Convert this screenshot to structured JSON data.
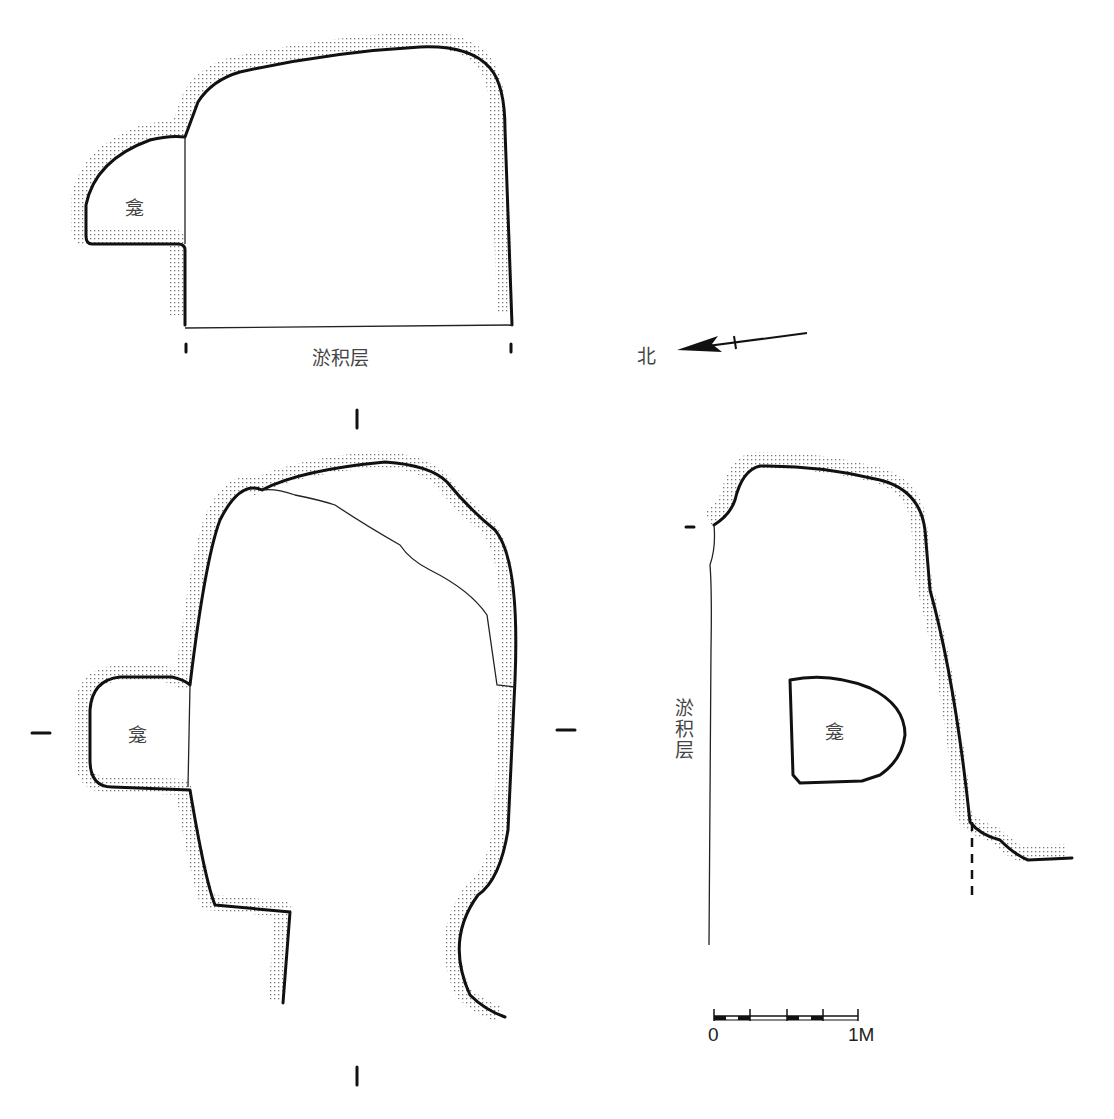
{
  "figure": {
    "type": "archaeological cave plan and sections",
    "plan_top": {
      "niche_label": "龛",
      "deposit_label": "淤积层"
    },
    "compass": {
      "label": "北",
      "direction": "north-arrow"
    },
    "plan_main": {
      "niche_label": "龛",
      "section_markers": [
        "I",
        "I",
        "—",
        "—"
      ]
    },
    "section_side": {
      "niche_label": "龛",
      "deposit_label": "淤积层"
    },
    "scale_bar": {
      "start_label": "0",
      "end_label": "1M"
    },
    "colors": {
      "line": "#111111",
      "text": "#444444",
      "background": "#ffffff"
    }
  }
}
